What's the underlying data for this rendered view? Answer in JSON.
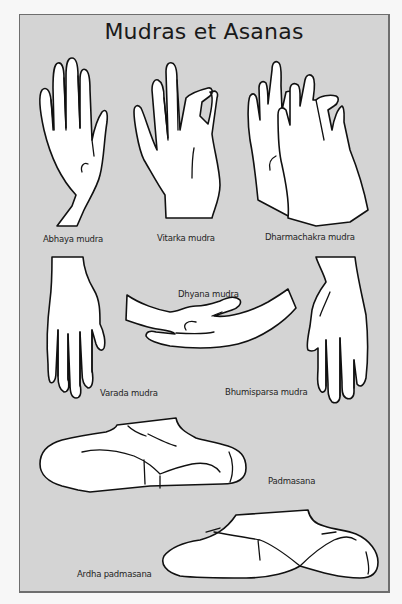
{
  "poster": {
    "title": "Mudras et Asanas",
    "colors": {
      "background": "#d4d4d4",
      "page": "#f7f7f7",
      "border": "#6e6e6e",
      "ink": "#111111",
      "fill": "#ffffff"
    }
  },
  "mudras": [
    {
      "id": "abhaya",
      "label": "Abhaya mudra",
      "icon": "raised-open-palm-hand-icon"
    },
    {
      "id": "vitarka",
      "label": "Vitarka mudra",
      "icon": "thumb-index-circle-hand-icon"
    },
    {
      "id": "dharmachakra",
      "label": "Dharmachakra mudra",
      "icon": "two-hands-wheel-gesture-icon"
    },
    {
      "id": "dhyana",
      "label": "Dhyana mudra",
      "icon": "meditation-hands-in-lap-icon"
    },
    {
      "id": "varada",
      "label": "Varada mudra",
      "icon": "downward-open-palm-hand-icon"
    },
    {
      "id": "bhumisparsa",
      "label": "Bhumisparsa mudra",
      "icon": "earth-touching-hand-icon"
    }
  ],
  "asanas": [
    {
      "id": "padmasana",
      "label": "Padmasana",
      "icon": "full-lotus-legs-icon"
    },
    {
      "id": "ardha_padmasana",
      "label": "Ardha padmasana",
      "icon": "half-lotus-legs-icon"
    }
  ]
}
